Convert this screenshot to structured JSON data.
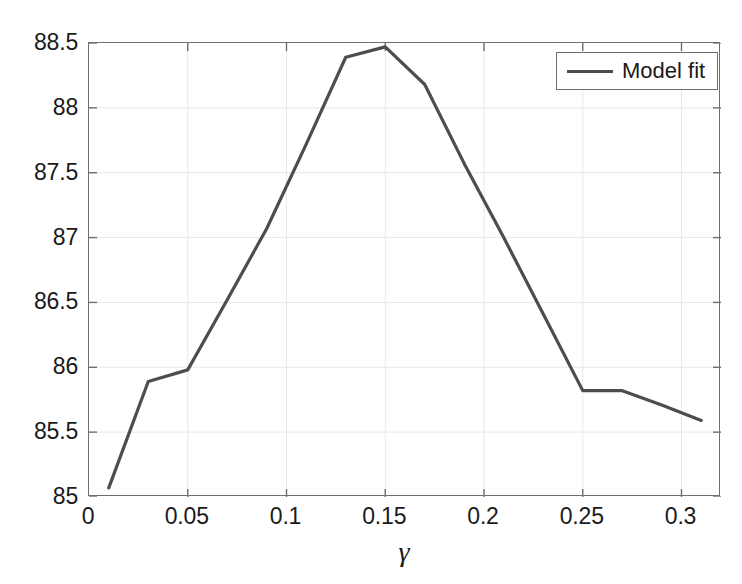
{
  "chart_data": {
    "type": "line",
    "title": "",
    "xlabel": "γ",
    "ylabel": "",
    "xlim": [
      0,
      0.32
    ],
    "ylim": [
      85,
      88.5
    ],
    "grid": true,
    "legend_position": "top-right",
    "xticks": [
      "0",
      "0.05",
      "0.1",
      "0.15",
      "0.2",
      "0.25",
      "0.3"
    ],
    "xtick_values": [
      0,
      0.05,
      0.1,
      0.15,
      0.2,
      0.25,
      0.3
    ],
    "yticks": [
      "85",
      "85.5",
      "86",
      "86.5",
      "87",
      "87.5",
      "88",
      "88.5"
    ],
    "ytick_values": [
      85,
      85.5,
      86,
      86.5,
      87,
      87.5,
      88,
      88.5
    ],
    "series": [
      {
        "name": "Model fit",
        "color": "#4d4d4d",
        "x": [
          0.01,
          0.03,
          0.05,
          0.07,
          0.09,
          0.11,
          0.13,
          0.15,
          0.17,
          0.19,
          0.21,
          0.23,
          0.25,
          0.27,
          0.29,
          0.31
        ],
        "values": [
          85.07,
          85.89,
          85.98,
          86.52,
          87.07,
          87.72,
          88.39,
          88.47,
          88.18,
          87.57,
          87.0,
          86.41,
          85.82,
          85.82,
          85.71,
          85.59
        ]
      }
    ]
  },
  "legend": {
    "label": "Model fit"
  },
  "axes": {
    "xlabel": "γ"
  },
  "colors": {
    "line": "#4d4d4d",
    "axis": "#6f6f6f",
    "grid": "#e8e8e8",
    "text": "#1a1a1a",
    "background": "#ffffff"
  }
}
